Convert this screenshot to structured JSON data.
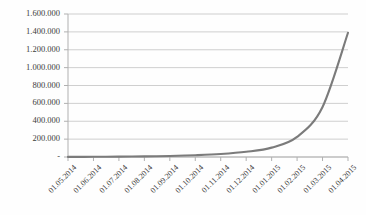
{
  "chart_data": {
    "type": "line",
    "title": "",
    "subtitle": "",
    "xlabel": "",
    "ylabel": "",
    "grid": true,
    "legend": false,
    "legend_position": "none",
    "number_format": "european-dot-thousands",
    "line_color": "#7b7b7b",
    "gridline_color": "#c9c9c9",
    "axis_color": "#b0b0b0",
    "background_color": "#fefefe",
    "text_color": "#3b3b3b",
    "ylim": [
      0,
      1600000
    ],
    "ytick_values": [
      0,
      200000,
      400000,
      600000,
      800000,
      1000000,
      1200000,
      1400000,
      1600000
    ],
    "ytick_labels": [
      "-",
      "200.000",
      "400.000",
      "600.000",
      "800.000",
      "1.000.000",
      "1.200.000",
      "1.400.000",
      "1.600.000"
    ],
    "categories": [
      "01.05.2014",
      "01.06.2014",
      "01.07.2014",
      "01.08.2014",
      "01.09.2014",
      "01.10.2014",
      "01.11.2014",
      "01.12.2014",
      "01.01.2015",
      "01.02.2015",
      "01.03.2015",
      "01.04.2015"
    ],
    "x": [
      "01.05.2014",
      "01.06.2014",
      "01.07.2014",
      "01.08.2014",
      "01.09.2014",
      "01.10.2014",
      "01.11.2014",
      "01.12.2014",
      "01.01.2015",
      "01.02.2015",
      "01.03.2015",
      "01.04.2015"
    ],
    "values": [
      1000,
      2000,
      4000,
      7000,
      12000,
      20000,
      33000,
      58000,
      105000,
      225000,
      560000,
      1390000
    ],
    "series": [
      {
        "name": "Wachstum",
        "values": [
          1000,
          2000,
          4000,
          7000,
          12000,
          20000,
          33000,
          58000,
          105000,
          225000,
          560000,
          1390000
        ]
      }
    ],
    "annotations": []
  }
}
